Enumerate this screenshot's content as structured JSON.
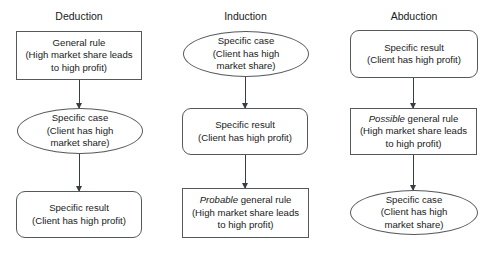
{
  "diagram": {
    "background": "#ffffff",
    "stroke_color": "#55585c",
    "arrow_color": "#3a3d40",
    "text_color": "#1a1a1a",
    "columns": [
      {
        "id": "deduction",
        "title": "Deduction",
        "nodes": [
          {
            "id": "deduction-node-1",
            "shape": "rect",
            "emphasis": "",
            "text": "General rule\n(High market share leads\nto high profit)"
          },
          {
            "id": "deduction-node-2",
            "shape": "ellipse",
            "emphasis": "",
            "text": "Specific case\n(Client has high\nmarket share)"
          },
          {
            "id": "deduction-node-3",
            "shape": "round",
            "emphasis": "",
            "text": "Specific result\n(Client has high profit)"
          }
        ]
      },
      {
        "id": "induction",
        "title": "Induction",
        "nodes": [
          {
            "id": "induction-node-1",
            "shape": "ellipse",
            "emphasis": "",
            "text": "Specific case\n(Client has high\nmarket share)"
          },
          {
            "id": "induction-node-2",
            "shape": "round",
            "emphasis": "",
            "text": "Specific result\n(Client has high profit)"
          },
          {
            "id": "induction-node-3",
            "shape": "rect",
            "emphasis": "Probable",
            "text": " general rule\n(High market share leads\nto high profit)"
          }
        ]
      },
      {
        "id": "abduction",
        "title": "Abduction",
        "nodes": [
          {
            "id": "abduction-node-1",
            "shape": "round",
            "emphasis": "",
            "text": "Specific result\n(Client has high profit)"
          },
          {
            "id": "abduction-node-2",
            "shape": "rect",
            "emphasis": "Possible",
            "text": " general rule\n(High market share leads\nto high profit)"
          },
          {
            "id": "abduction-node-3",
            "shape": "ellipse",
            "emphasis": "",
            "text": "Specific case\n(Client has high\nmarket share)"
          }
        ]
      }
    ]
  }
}
